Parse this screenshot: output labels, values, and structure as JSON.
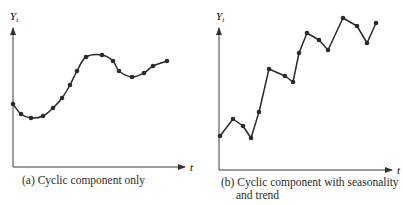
{
  "chart_data": [
    {
      "type": "line",
      "title": "(a) Cyclic component only",
      "xlabel": "t",
      "ylabel": "Y_t",
      "grid": false,
      "legend": null,
      "x": [
        1,
        2,
        3,
        4,
        5,
        6,
        7,
        8,
        9,
        10,
        11,
        12,
        13,
        14,
        15,
        16
      ],
      "values": [
        4.6,
        3.9,
        3.6,
        3.75,
        4.3,
        5.0,
        5.9,
        6.9,
        7.9,
        8.0,
        7.6,
        6.9,
        6.5,
        6.75,
        7.25,
        7.6
      ],
      "ylim": [
        0,
        10
      ],
      "note": "Smooth wave-like cyclic pattern with markers at each observation; axes without tick values"
    },
    {
      "type": "line",
      "title": "(b) Cyclic component with seasonality and trend",
      "xlabel": "t",
      "ylabel": "Y_t",
      "grid": false,
      "legend": null,
      "x": [
        1,
        2,
        3,
        4,
        5,
        6,
        7,
        8,
        9,
        10,
        11,
        12,
        13,
        14,
        15,
        16
      ],
      "values": [
        2.4,
        3.6,
        3.1,
        2.3,
        4.1,
        7.1,
        6.6,
        6.2,
        8.2,
        9.6,
        9.1,
        8.4,
        10.6,
        10.1,
        8.9,
        10.3
      ],
      "ylim": [
        0,
        11.5
      ],
      "note": "Saw-tooth seasonal pattern superimposed on an upward trend; axes without tick values"
    }
  ],
  "panels": {
    "a": {
      "y_axis_label": "Y",
      "y_axis_sub": "t",
      "x_axis_label": "t",
      "caption_line1": "(a) Cyclic component only",
      "points": [
        [
          13,
          104
        ],
        [
          21,
          114
        ],
        [
          31,
          118
        ],
        [
          43,
          116
        ],
        [
          53,
          108
        ],
        [
          62,
          98
        ],
        [
          70,
          85
        ],
        [
          77,
          71
        ],
        [
          86,
          57
        ],
        [
          102,
          55
        ],
        [
          113,
          61
        ],
        [
          119,
          71
        ],
        [
          132,
          77
        ],
        [
          144,
          73
        ],
        [
          153,
          66
        ],
        [
          167,
          61
        ]
      ]
    },
    "b": {
      "y_axis_label": "Y",
      "y_axis_sub": "t",
      "x_axis_label": "t",
      "caption_line1": "(b) Cyclic component with seasonality",
      "caption_line2": "and trend",
      "points": [
        [
          220,
          136
        ],
        [
          233,
          119
        ],
        [
          243,
          126
        ],
        [
          251,
          138
        ],
        [
          259,
          112
        ],
        [
          269,
          69
        ],
        [
          285,
          76
        ],
        [
          293,
          82
        ],
        [
          299,
          53
        ],
        [
          307,
          33
        ],
        [
          319,
          40
        ],
        [
          328,
          50
        ],
        [
          343,
          18
        ],
        [
          357,
          26
        ],
        [
          367,
          43
        ],
        [
          376,
          23
        ]
      ]
    }
  },
  "colors": {
    "line": "#2b2b2b",
    "axis": "#3a3a3a",
    "marker": "#2b2b2b",
    "background": "#ffffff"
  }
}
